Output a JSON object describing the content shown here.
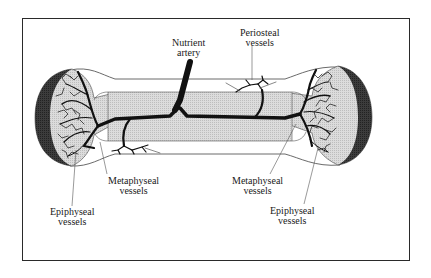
{
  "diagram": {
    "colors": {
      "frame": "#2a2a2a",
      "cartilage_cap": "#3a3a3a",
      "bone_fill": "#d6d6d6",
      "marrow_fill": "#cfcfcf",
      "vessel": "#111111",
      "leader_line": "#555555",
      "background": "#ffffff"
    },
    "labels": {
      "nutrient_artery": {
        "line1": "Nutrient",
        "line2": "artery"
      },
      "periosteal_vessels": {
        "line1": "Periosteal",
        "line2": "vessels"
      },
      "metaphyseal_left": {
        "line1": "Metaphyseal",
        "line2": "vessels"
      },
      "metaphyseal_right": {
        "line1": "Metaphyseal",
        "line2": "vessels"
      },
      "epiphyseal_left": {
        "line1": "Epiphyseal",
        "line2": "vessels"
      },
      "epiphyseal_right": {
        "line1": "Epiphyseal",
        "line2": "vessels"
      }
    }
  }
}
